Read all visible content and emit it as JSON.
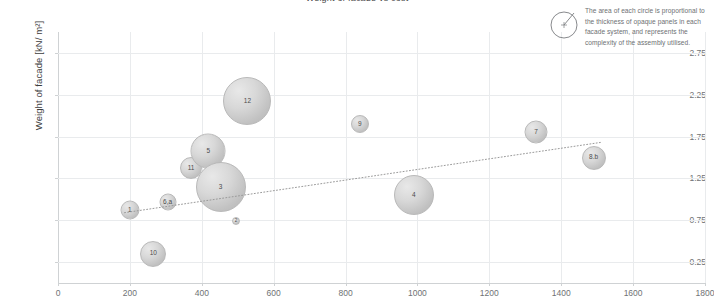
{
  "figure": {
    "title_partial": "Weight of facade vs cost",
    "width": 714,
    "height": 303,
    "background": "#ffffff",
    "grid_color": "#e9ebed",
    "bubble_fill": "#d4d4d4",
    "bubble_stroke": "#b9b9b9",
    "label_color": "#6f7275"
  },
  "annotation": {
    "icon": "circle-with-radius-icon",
    "text": "The area of each circle is proportional to the thickness of opaque panels in each facade system, and represents the complexity of the assembly utilised."
  },
  "chart_data": {
    "type": "scatter",
    "title": "",
    "xlabel": "",
    "ylabel": "Weight of facade [kN/ m²]",
    "xlim": [
      0,
      1800
    ],
    "ylim": [
      0,
      3.0
    ],
    "xticks": [
      0,
      200,
      400,
      600,
      800,
      1000,
      1200,
      1400,
      1600,
      1800
    ],
    "yticks": [
      0.25,
      0.75,
      1.25,
      1.75,
      2.25,
      2.75
    ],
    "xtick_labels": [
      "0",
      "200",
      "400",
      "600",
      "800",
      "1000",
      "1200",
      "1400",
      "1600",
      "1800"
    ],
    "ytick_labels": [
      "0.25",
      "0.75",
      "1.25",
      "1.75",
      "2.25",
      "2.75"
    ],
    "grid": true,
    "legend": "none",
    "size_encoding": "Bubble area proportional to thickness of opaque panels (assembly complexity)",
    "points": [
      {
        "label": "1",
        "x": 200,
        "y": 0.87,
        "r": 9.5
      },
      {
        "label": "10",
        "x": 265,
        "y": 0.35,
        "r": 13.0
      },
      {
        "label": "6,a",
        "x": 305,
        "y": 0.97,
        "r": 8.5
      },
      {
        "label": "11",
        "x": 370,
        "y": 1.37,
        "r": 11.0
      },
      {
        "label": "5",
        "x": 418,
        "y": 1.58,
        "r": 17.5
      },
      {
        "label": "3",
        "x": 452,
        "y": 1.15,
        "r": 25.0
      },
      {
        "label": "2",
        "x": 495,
        "y": 0.74,
        "r": 4.0
      },
      {
        "label": "12",
        "x": 527,
        "y": 2.17,
        "r": 24.0
      },
      {
        "label": "9",
        "x": 840,
        "y": 1.9,
        "r": 9.0
      },
      {
        "label": "4",
        "x": 990,
        "y": 1.05,
        "r": 20.0
      },
      {
        "label": "7",
        "x": 1330,
        "y": 1.81,
        "r": 11.5
      },
      {
        "label": "8.b",
        "x": 1490,
        "y": 1.5,
        "r": 12.0
      }
    ],
    "trendline": {
      "style": "dotted",
      "color": "#9a9a9a",
      "x_start": 185,
      "y_start": 0.84,
      "x_end": 1510,
      "y_end": 1.68
    }
  }
}
